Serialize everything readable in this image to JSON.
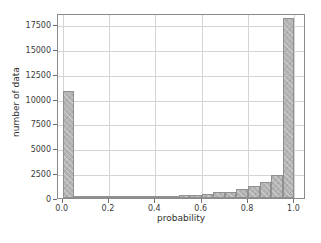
{
  "chart_data": {
    "type": "bar",
    "title": "",
    "xlabel": "probability",
    "ylabel": "number of data",
    "xlim": [
      -0.02,
      1.05
    ],
    "ylim": [
      0,
      18600
    ],
    "grid": true,
    "legend": null,
    "bin_width": 0.05,
    "xticks": [
      0.0,
      0.2,
      0.4,
      0.6,
      0.8,
      1.0
    ],
    "xtick_labels": [
      "0.0",
      "0.2",
      "0.4",
      "0.6",
      "0.8",
      "1.0"
    ],
    "yticks": [
      0,
      2500,
      5000,
      7500,
      10000,
      12500,
      15000,
      17500
    ],
    "ytick_labels": [
      "0",
      "2500",
      "5000",
      "7500",
      "10000",
      "12500",
      "15000",
      "17500"
    ],
    "bin_edges": [
      0.0,
      0.05,
      0.1,
      0.15,
      0.2,
      0.25,
      0.3,
      0.35,
      0.4,
      0.45,
      0.5,
      0.55,
      0.6,
      0.65,
      0.7,
      0.75,
      0.8,
      0.85,
      0.9,
      0.95,
      1.0
    ],
    "categories": [
      "0.00-0.05",
      "0.05-0.10",
      "0.10-0.15",
      "0.15-0.20",
      "0.20-0.25",
      "0.25-0.30",
      "0.30-0.35",
      "0.35-0.40",
      "0.40-0.45",
      "0.45-0.50",
      "0.50-0.55",
      "0.55-0.60",
      "0.60-0.65",
      "0.65-0.70",
      "0.70-0.75",
      "0.75-0.80",
      "0.80-0.85",
      "0.85-0.90",
      "0.90-0.95",
      "0.95-1.00"
    ],
    "values": [
      10800,
      230,
      60,
      50,
      60,
      90,
      110,
      130,
      170,
      210,
      300,
      330,
      430,
      580,
      650,
      900,
      1180,
      1620,
      2350,
      3550
    ],
    "last_bar_value": 18100,
    "bar_color": "#b4b4b4",
    "bar_edge_color": "#909090",
    "grid_color": "#d4d4d4",
    "axes_color": "#8a8a8a",
    "background": "#ffffff"
  }
}
